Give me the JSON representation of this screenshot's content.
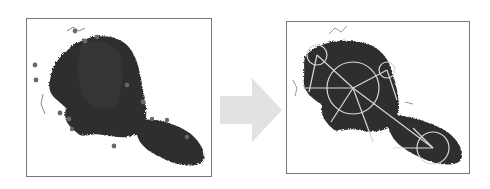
{
  "diagram": {
    "colors": {
      "frame_border": "#777777",
      "silhouette": "#2e2e2e",
      "keypoint_dots": "#6a6a6a",
      "overlay_lines": "#d8d8d8",
      "arrow_fill": "#e2e2e2",
      "background": "#ffffff"
    },
    "panels": [
      {
        "id": "left",
        "label": "",
        "content": "silhouette-with-points"
      },
      {
        "id": "right",
        "label": "",
        "content": "silhouette-with-skeleton"
      }
    ],
    "arrow": {
      "direction": "right",
      "label": ""
    }
  }
}
